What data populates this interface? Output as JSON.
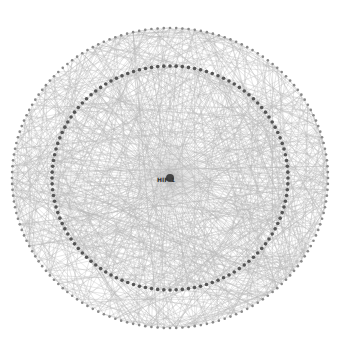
{
  "diagram": {
    "type": "radial-network",
    "center_node": {
      "label": "HIF-1"
    },
    "inner_ring": {
      "node_count": 120,
      "color": "#555555"
    },
    "outer_ring": {
      "node_count": 160,
      "color": "#888888"
    },
    "edge_color": "#9a9a9a",
    "caption": ""
  }
}
